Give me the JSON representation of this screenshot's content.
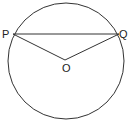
{
  "diagram": {
    "type": "geometry",
    "labels": {
      "P": "P",
      "Q": "Q",
      "O": "O"
    },
    "colors": {
      "stroke": "#333333",
      "background": "#ffffff",
      "text": "#222222"
    }
  }
}
